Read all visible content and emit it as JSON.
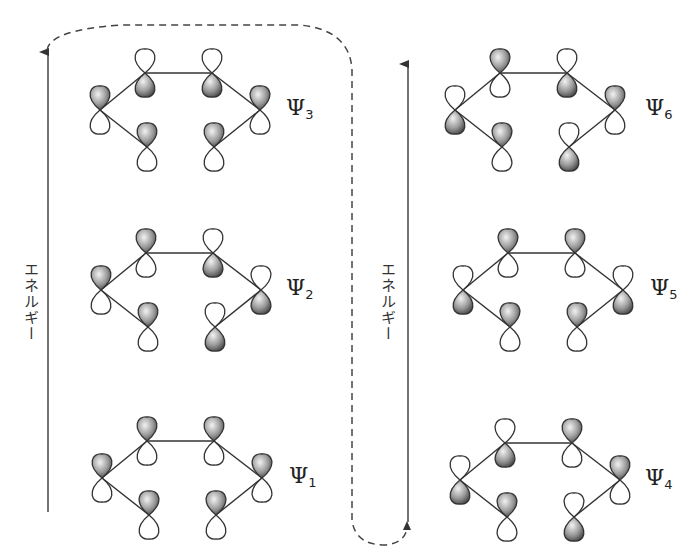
{
  "axis": {
    "left_label": "エネルギー",
    "right_label": "エネルギー"
  },
  "orbitals": [
    {
      "id": "psi1",
      "symbol": "Ψ",
      "index": "1",
      "column": "left",
      "origin": [
        102,
        478
      ],
      "phases": {
        "left": "up",
        "top_left": "up",
        "top_right": "up",
        "right": "up",
        "bottom_left": "up",
        "bottom_right": "up"
      }
    },
    {
      "id": "psi2",
      "symbol": "Ψ",
      "index": "2",
      "column": "left",
      "origin": [
        101,
        290
      ],
      "phases": {
        "left": "up",
        "top_left": "up",
        "top_right": "down",
        "right": "down",
        "bottom_left": "up",
        "bottom_right": "down"
      }
    },
    {
      "id": "psi3",
      "symbol": "Ψ",
      "index": "3",
      "column": "left",
      "origin": [
        100,
        110
      ],
      "phases": {
        "left": "up",
        "top_left": "down",
        "top_right": "down",
        "right": "up",
        "bottom_left": "up",
        "bottom_right": "up"
      }
    },
    {
      "id": "psi4",
      "symbol": "Ψ",
      "index": "4",
      "column": "right",
      "origin": [
        460,
        480
      ],
      "phases": {
        "left": "down",
        "top_left": "down",
        "top_right": "up",
        "right": "up",
        "bottom_left": "up",
        "bottom_right": "down"
      }
    },
    {
      "id": "psi5",
      "symbol": "Ψ",
      "index": "5",
      "column": "right",
      "origin": [
        463,
        290
      ],
      "phases": {
        "left": "down",
        "top_left": "up",
        "top_right": "up",
        "right": "down",
        "bottom_left": "up",
        "bottom_right": "up"
      }
    },
    {
      "id": "psi6",
      "symbol": "Ψ",
      "index": "6",
      "column": "right",
      "origin": [
        455,
        110
      ],
      "phases": {
        "left": "down",
        "top_left": "up",
        "top_right": "down",
        "right": "up",
        "bottom_left": "up",
        "bottom_right": "down"
      }
    }
  ],
  "labels": {
    "psi1": {
      "symbol": "Ψ",
      "index": "1"
    },
    "psi2": {
      "symbol": "Ψ",
      "index": "2"
    },
    "psi3": {
      "symbol": "Ψ",
      "index": "3"
    },
    "psi4": {
      "symbol": "Ψ",
      "index": "4"
    },
    "psi5": {
      "symbol": "Ψ",
      "index": "5"
    },
    "psi6": {
      "symbol": "Ψ",
      "index": "6"
    }
  },
  "colors": {
    "line": "#333333",
    "shaded_dark": "#555555",
    "shaded_light": "#e8e8e8",
    "lobe_white": "#ffffff"
  }
}
